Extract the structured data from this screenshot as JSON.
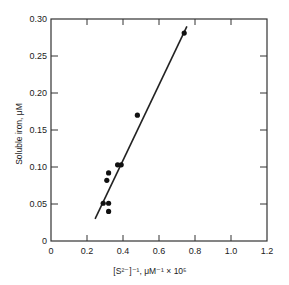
{
  "chart_data": {
    "type": "scatter",
    "title": "",
    "xlabel": "[S²⁻]⁻¹, μM⁻¹ × 10⁵",
    "ylabel": "Soluble iron, μM",
    "xlim": [
      0,
      1.2
    ],
    "ylim": [
      0,
      0.3
    ],
    "xticks": [
      0,
      0.2,
      0.4,
      0.6,
      0.8,
      1.0,
      1.2
    ],
    "xtick_labels": [
      "0",
      "0.2",
      "0.4",
      "0.6",
      "0.8",
      "1.0",
      "1.2"
    ],
    "yticks": [
      0,
      0.05,
      0.1,
      0.15,
      0.2,
      0.25,
      0.3
    ],
    "ytick_labels": [
      "0",
      "0.05",
      "0.10",
      "0.15",
      "0.20",
      "0.25",
      "0.30"
    ],
    "grid": false,
    "legend": null,
    "series": [
      {
        "name": "measured",
        "type": "scatter",
        "x": [
          0.29,
          0.32,
          0.32,
          0.31,
          0.32,
          0.37,
          0.39,
          0.48,
          0.74
        ],
        "y": [
          0.051,
          0.051,
          0.04,
          0.082,
          0.092,
          0.103,
          0.103,
          0.17,
          0.281
        ]
      },
      {
        "name": "fit",
        "type": "line",
        "x": [
          0.245,
          0.755
        ],
        "y": [
          0.03,
          0.29
        ]
      }
    ]
  }
}
